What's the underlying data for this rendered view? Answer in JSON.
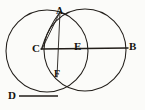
{
  "figure": {
    "kind": "geometric-construction-diagram",
    "caption": "",
    "background_color": "#fbfbf9",
    "ink_color": "#221e1a",
    "stroke_width": 1.0,
    "width": 145,
    "height": 110,
    "labels": [
      {
        "id": "A",
        "text": "A",
        "x": 56,
        "y": 5
      },
      {
        "id": "B",
        "text": "B",
        "x": 129,
        "y": 41
      },
      {
        "id": "C",
        "text": "C",
        "x": 32,
        "y": 43
      },
      {
        "id": "D",
        "text": "D",
        "x": 8,
        "y": 90
      },
      {
        "id": "E",
        "text": "E",
        "x": 74,
        "y": 41
      },
      {
        "id": "F",
        "text": "F",
        "x": 54,
        "y": 68
      }
    ],
    "circles": [
      {
        "id": "left-circle",
        "cx": 47,
        "cy": 51,
        "r": 41
      },
      {
        "id": "right-circle",
        "cx": 85,
        "cy": 50,
        "r": 41
      }
    ],
    "segments": [
      {
        "id": "segment-CB",
        "x1": 41,
        "y1": 49,
        "x2": 128,
        "y2": 48
      },
      {
        "id": "segment-AC",
        "x1": 60,
        "y1": 12,
        "x2": 41,
        "y2": 49
      },
      {
        "id": "segment-AF",
        "x1": 60,
        "y1": 12,
        "x2": 57,
        "y2": 76
      },
      {
        "id": "segment-D-tick",
        "x1": 19,
        "y1": 96,
        "x2": 58,
        "y2": 96
      }
    ]
  }
}
